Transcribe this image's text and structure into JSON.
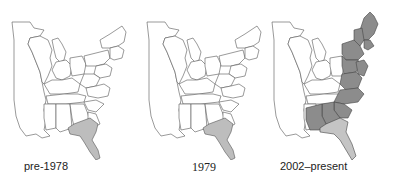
{
  "figure": {
    "panels": [
      {
        "id": "pre-1978",
        "caption": "pre-1978",
        "highlight": "Georgia (south) and Florida",
        "fill_colors": {
          "range": "#bdbdbd"
        }
      },
      {
        "id": "1979",
        "caption": "1979",
        "highlight": "Georgia (south) and Florida",
        "fill_colors": {
          "range": "#bdbdbd"
        }
      },
      {
        "id": "2002-present",
        "caption": "2002–present",
        "highlight": "Atlantic coast states from Maine to Florida, plus Alabama",
        "fill_colors": {
          "dark": "#8c8c8c",
          "light": "#c4c4c4"
        }
      }
    ],
    "colors": {
      "outline": "#555555",
      "background": "#ffffff",
      "original_range": "#bdbdbd",
      "expanded_range": "#8c8c8c",
      "florida_2002": "#c4c4c4"
    }
  }
}
